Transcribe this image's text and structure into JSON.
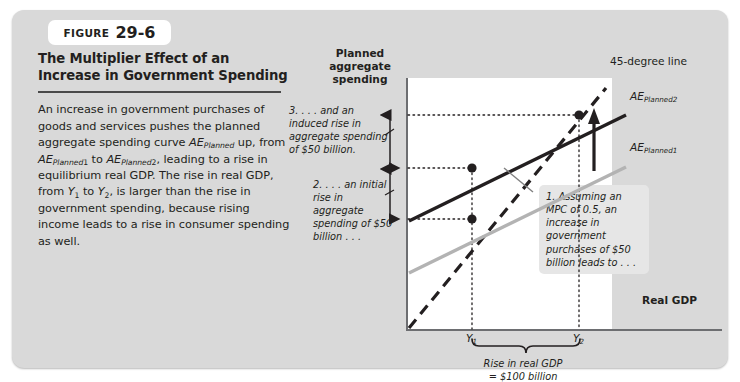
{
  "figure": {
    "tab_label": "FIGURE",
    "tab_number": "29-6",
    "title": "The Multiplier Effect of an Increase in Government Spending",
    "description_html": "An increase in government purchases of goods and services pushes the planned aggregate spending curve <i>AE<sub>Planned</sub></i> up, from <i>AE<sub>Planned</sub></i><sub>1</sub> to <i>AE<sub>Planned</sub></i><sub>2</sub>, leading to a rise in equilibrium real GDP. The rise in real GDP, from <i>Y</i><sub>1</sub> to <i>Y</i><sub>2</sub>, is larger than the rise in government spending, because rising income leads to a rise in consumer spending as well."
  },
  "chart_data": {
    "type": "line",
    "title": "The Multiplier Effect of an Increase in Government Spending",
    "xlabel": "Real GDP",
    "ylabel": "Planned aggregate spending",
    "grid": "dotted-guides",
    "legend": "inline-curve-labels",
    "xticks": [
      "Y₁",
      "Y₂"
    ],
    "xtick_values": [
      100,
      200
    ],
    "series": [
      {
        "name": "45-degree line",
        "style": "dashed",
        "color": "#231f20",
        "points": [
          [
            0,
            0
          ],
          [
            230,
            230
          ]
        ]
      },
      {
        "name": "AE_Planned1",
        "style": "solid",
        "color": "#b3b3b3",
        "points": [
          [
            0,
            25
          ],
          [
            230,
            140
          ]
        ],
        "slope": 0.5,
        "intercept": 25
      },
      {
        "name": "AE_Planned2",
        "style": "solid",
        "color": "#231f20",
        "points": [
          [
            0,
            75
          ],
          [
            230,
            190
          ]
        ],
        "slope": 0.5,
        "intercept": 75
      }
    ],
    "equilibria": [
      {
        "label": "initial equilibrium",
        "x": 100,
        "y": 100
      },
      {
        "label": "new equilibrium",
        "x": 200,
        "y": 200
      }
    ],
    "markers": [
      {
        "label": "AE2 at Y1",
        "x": 100,
        "y": 150
      }
    ],
    "annotations": {
      "initial_rise": "$50 billion",
      "induced_rise": "$50 billion",
      "total_gdp_rise": "$100 billion",
      "mpc": "0.5"
    }
  },
  "labels": {
    "y_axis_title": "Planned aggregate spending",
    "x_axis_title": "Real GDP",
    "y1": "Y",
    "y1_sub": "1",
    "y2": "Y",
    "y2_sub": "2",
    "line_45": "45-degree line",
    "ae_planned_2_main": "AE",
    "ae_planned_2_sub": "Planned",
    "ae_planned_2_num": "2",
    "ae_planned_1_main": "AE",
    "ae_planned_1_sub": "Planned",
    "ae_planned_1_num": "1"
  },
  "annotations": {
    "step1": "1. Assuming an MPC of 0.5, an increase in government purchases of $50 billion leads to . . .",
    "step2": "2. . . . an initial rise in aggregate spending of $50 billion . . .",
    "step3": "3. . . . and an induced rise in aggregate spending of $50 billion.",
    "bracket_line1": "Rise in real GDP",
    "bracket_line2": "= $100 billion"
  },
  "colors": {
    "card_bg": "#d9d9d9",
    "plot_bg": "#ffffff",
    "axis": "#6d6e71",
    "ae2_line": "#231f20",
    "ae1_line": "#b3b3b3",
    "callout_bg": "#e6e6e6",
    "text": "#231f20"
  }
}
